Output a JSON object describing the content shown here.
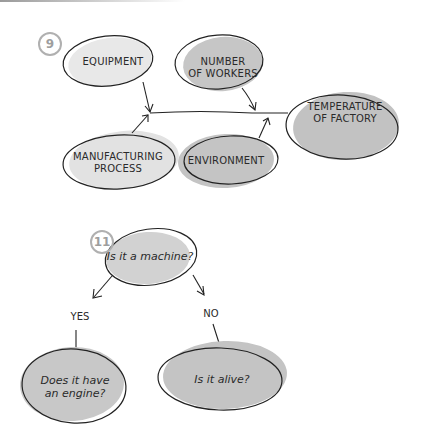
{
  "diagram_9": {
    "number": "9",
    "nodes": {
      "equipment": "EQUIPMENT",
      "workers_line1": "NUMBER",
      "workers_line2": "OF WORKERS",
      "temperature_line1": "TEMPERATURE",
      "temperature_line2": "OF FACTORY",
      "manufacturing_line1": "MANUFACTURING",
      "manufacturing_line2": "PROCESS",
      "environment": "ENVIRONMENT"
    }
  },
  "diagram_11": {
    "number": "11",
    "root": "Is it a machine?",
    "branch_yes": "YES",
    "branch_no": "NO",
    "yes_node_line1": "Does it have",
    "yes_node_line2": "an engine?",
    "no_node": "Is it alive?"
  },
  "colors": {
    "fill_light": "#e6e6e6",
    "fill_dark": "#c4c4c4",
    "stroke": "#222222",
    "number_ring": "#b0b0b0"
  }
}
